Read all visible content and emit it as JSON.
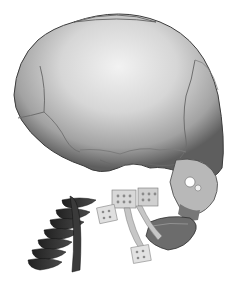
{
  "image": {
    "subject": "3D CT rendering of infant skull with cervical spine and mandibular distraction plates",
    "background_color": "#ffffff",
    "colors": {
      "skull_light": "#e4e4e4",
      "skull_mid": "#a8a8a8",
      "skull_dark": "#5a5a5a",
      "spine": "#3a3a3a",
      "plates": "#cfcfcf",
      "mandible": "#6a6a6a"
    }
  }
}
